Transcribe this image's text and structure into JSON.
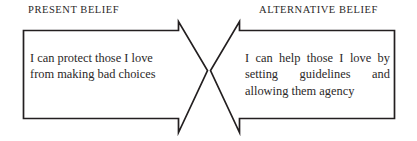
{
  "diagram": {
    "type": "two-opposing-arrows",
    "background_color": "#ffffff",
    "stroke_color": "#231f20",
    "text_color": "#2b2828",
    "left": {
      "heading": "PRESENT BELIEF",
      "statement": "I can protect those I love from making bad choices",
      "lines": [
        "I can protect those I",
        "love from making bad",
        "choices"
      ],
      "arrow_direction": "right"
    },
    "right": {
      "heading": "ALTERNATIVE BELIEF",
      "statement": "I can help those I love by setting guidelines and allowing them agency",
      "lines": [
        "I can help those I love by",
        "setting guidelines and",
        "allowing them agency"
      ],
      "arrow_direction": "left"
    }
  }
}
